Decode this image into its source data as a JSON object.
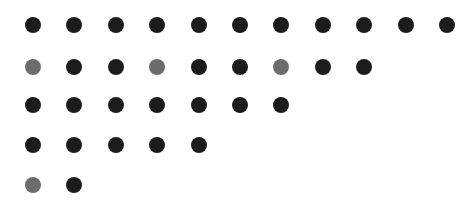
{
  "colors": {
    "dark": "#1c1c1c",
    "gray": "#6c6c6c"
  },
  "layout": {
    "x0": 33,
    "dx": 41.4,
    "row_y": [
      25,
      67,
      105,
      145,
      185
    ]
  },
  "rows": [
    [
      "dark",
      "dark",
      "dark",
      "dark",
      "dark",
      "dark",
      "dark",
      "dark",
      "dark",
      "dark",
      "dark"
    ],
    [
      "gray",
      "dark",
      "dark",
      "gray",
      "dark",
      "dark",
      "gray",
      "dark",
      "dark"
    ],
    [
      "dark",
      "dark",
      "dark",
      "dark",
      "dark",
      "dark",
      "dark"
    ],
    [
      "dark",
      "dark",
      "dark",
      "dark",
      "dark"
    ],
    [
      "gray",
      "dark"
    ]
  ]
}
